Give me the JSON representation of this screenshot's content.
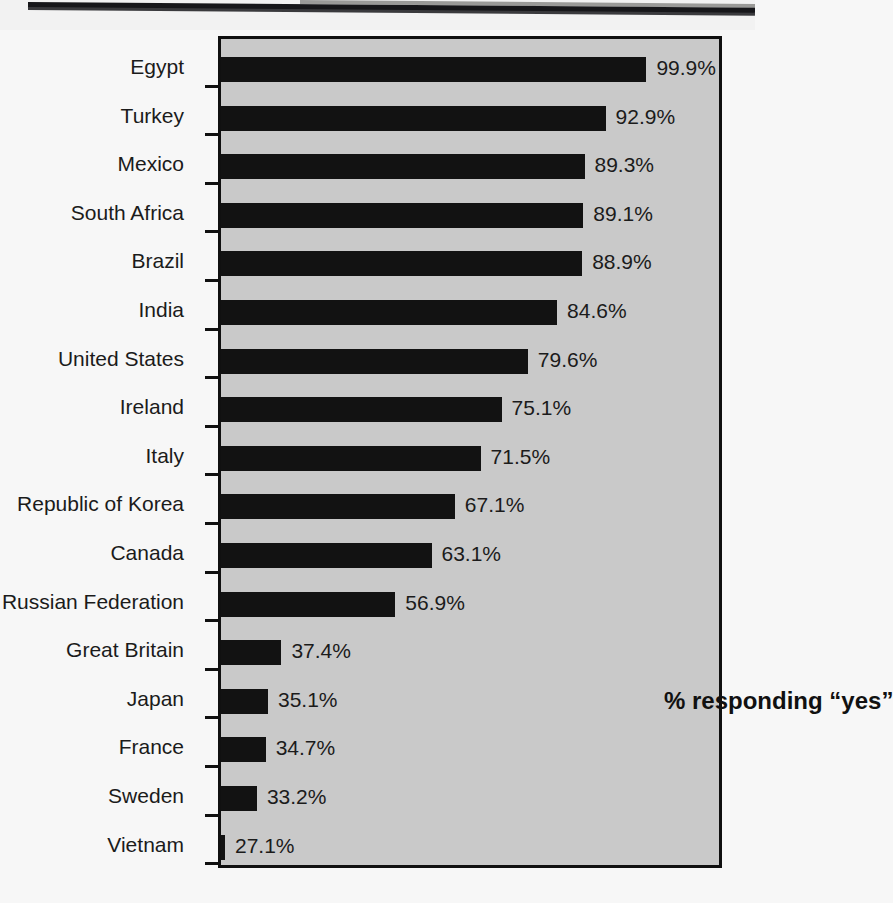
{
  "chart_data": {
    "type": "bar",
    "orientation": "horizontal",
    "title": "",
    "subtitle": "",
    "xlabel": "",
    "ylabel": "",
    "annotation": "% responding “yes”",
    "grid": false,
    "legend_position": "none",
    "value_suffix": "%",
    "xlim": [
      0,
      100
    ],
    "categories": [
      "Egypt",
      "Turkey",
      "Mexico",
      "South Africa",
      "Brazil",
      "India",
      "United States",
      "Ireland",
      "Italy",
      "Republic of Korea",
      "Canada",
      "Russian Federation",
      "Great Britain",
      "Japan",
      "France",
      "Sweden",
      "Vietnam"
    ],
    "values": [
      99.9,
      92.9,
      89.3,
      89.1,
      88.9,
      84.6,
      79.6,
      75.1,
      71.5,
      67.1,
      63.1,
      56.9,
      37.4,
      35.1,
      34.7,
      33.2,
      27.1
    ],
    "value_labels": [
      "99.9%",
      "92.9%",
      "89.3%",
      "89.1%",
      "88.9%",
      "84.6%",
      "79.6%",
      "75.1%",
      "71.5%",
      "67.1%",
      "63.1%",
      "56.9%",
      "37.4%",
      "35.1%",
      "34.7%",
      "33.2%",
      "27.1%"
    ],
    "colors": {
      "bar": "#121212",
      "plot_background": "#c9c9c9",
      "page_background": "#f7f7f7",
      "axis": "#101010",
      "text": "#1b1b1b"
    }
  }
}
